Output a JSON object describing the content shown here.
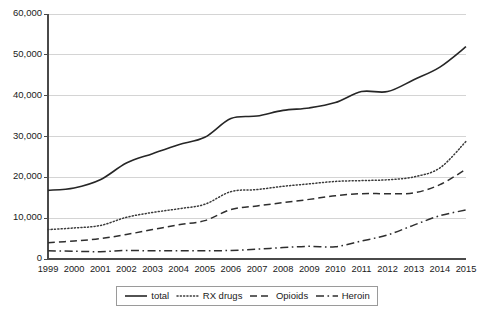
{
  "chart_data": {
    "type": "line",
    "title": "",
    "subtitle": "",
    "xlabel": "",
    "ylabel": "",
    "x": [
      1999,
      2000,
      2001,
      2002,
      2003,
      2004,
      2005,
      2006,
      2007,
      2008,
      2009,
      2010,
      2011,
      2012,
      2013,
      2014,
      2015
    ],
    "categories": [
      "1999",
      "2000",
      "2001",
      "2002",
      "2003",
      "2004",
      "2005",
      "2006",
      "2007",
      "2008",
      "2009",
      "2010",
      "2011",
      "2012",
      "2013",
      "2014",
      "2015"
    ],
    "xlim": [
      1999,
      2015
    ],
    "ylim": [
      0,
      60000
    ],
    "ytick_values": [
      0,
      10000,
      20000,
      30000,
      40000,
      50000,
      60000
    ],
    "ytick_labels": [
      "0",
      "10,000",
      "20,000",
      "30,000",
      "40,000",
      "50,000",
      "60,000"
    ],
    "grid": true,
    "grid_axis": "y",
    "legend_position": "bottom",
    "series": [
      {
        "name": "total",
        "style": "solid",
        "color": "#262626",
        "values": [
          16800,
          17400,
          19400,
          23500,
          25800,
          28000,
          29800,
          34400,
          35000,
          36400,
          37000,
          38300,
          41000,
          41000,
          43900,
          47000,
          52000
        ]
      },
      {
        "name": "RX drugs",
        "style": "dotted",
        "color": "#3a3a3a",
        "values": [
          7200,
          7600,
          8200,
          10200,
          11400,
          12300,
          13400,
          16500,
          17000,
          17800,
          18400,
          19000,
          19200,
          19400,
          20100,
          22300,
          28800
        ]
      },
      {
        "name": "Opioids",
        "style": "dashed",
        "color": "#2e2e2e",
        "values": [
          4000,
          4400,
          5000,
          6000,
          7200,
          8400,
          9400,
          12100,
          13000,
          13800,
          14600,
          15500,
          16000,
          16000,
          16200,
          18200,
          22000
        ]
      },
      {
        "name": "Heroin",
        "style": "dash-dot",
        "color": "#2e2e2e",
        "values": [
          2000,
          1900,
          1800,
          2100,
          2000,
          2000,
          2000,
          2100,
          2400,
          2800,
          3100,
          3000,
          4400,
          5900,
          8300,
          10600,
          12000
        ]
      }
    ]
  },
  "legend": {
    "entries": [
      {
        "label": "total",
        "swatch_name": "legend-swatch-solid-line"
      },
      {
        "label": "RX drugs",
        "swatch_name": "legend-swatch-dotted-line"
      },
      {
        "label": "Opioids",
        "swatch_name": "legend-swatch-dashed-line"
      },
      {
        "label": "Heroin",
        "swatch_name": "legend-swatch-dash-dot-line"
      }
    ]
  },
  "colors": {
    "line": "#262626",
    "gridline": "#d4d4d4",
    "axis": "#4a4a4a",
    "background": "#ffffff",
    "legend_border": "#9a9a9a"
  }
}
